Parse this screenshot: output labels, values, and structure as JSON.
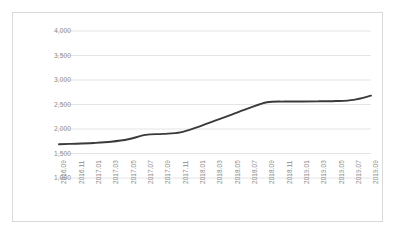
{
  "chart_data": {
    "type": "line",
    "title": "",
    "subtitle": "",
    "xlabel": "",
    "ylabel": "",
    "grid": true,
    "legend": false,
    "legend_position": "none",
    "line_color": "#3a3a3a",
    "background_color": "#ffffff",
    "border_color": "#d9d9d9",
    "gridline_color": "#e4e4e4",
    "tick_label_color": "#8c8c8c",
    "ylim": [
      1000,
      4000
    ],
    "yticks": [
      1000,
      1500,
      2000,
      2500,
      3000,
      3500,
      4000
    ],
    "ytick_labels": [
      "1,000",
      "1,500",
      "2,000",
      "2,500",
      "3,000",
      "3,500",
      "4,000"
    ],
    "categories": [
      "2016.09",
      "2016.11",
      "2017.01",
      "2017.03",
      "2017.05",
      "2017.07",
      "2017.09",
      "2017.11",
      "2018.01",
      "2018.03",
      "2018.05",
      "2018.07",
      "2018.09",
      "2018.11",
      "2019.01",
      "2019.03",
      "2019.05",
      "2019.07",
      "2019.09"
    ],
    "values": [
      1690,
      1700,
      1715,
      1740,
      1790,
      1880,
      1900,
      1930,
      2040,
      2170,
      2300,
      2430,
      2545,
      2560,
      2560,
      2565,
      2570,
      2595,
      2680
    ]
  }
}
